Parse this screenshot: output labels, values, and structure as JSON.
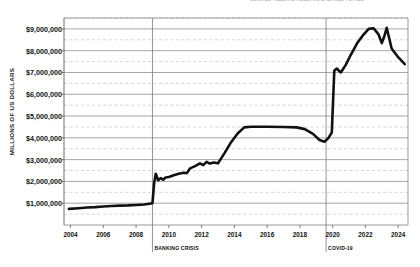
{
  "header": {
    "clipped_title": "SOURCE  FEDERAL RESERVE  BALANCE  TOTALS"
  },
  "axes": {
    "ylabel": "MILLIONS OF US DOLLARS",
    "xlabel": "",
    "y_ticks": [
      "$1,000,000",
      "$2,000,000",
      "$3,000,000",
      "$4,000,000",
      "$5,000,000",
      "$6,000,000",
      "$7,000,000",
      "$8,000,000",
      "$9,000,000"
    ],
    "x_ticks": [
      "2004",
      "2006",
      "2008",
      "2010",
      "2012",
      "2014",
      "2016",
      "2018",
      "2020",
      "2022",
      "2024"
    ]
  },
  "annotations": [
    {
      "name": "banking-crisis",
      "label": "BANKING CRISIS",
      "x": 2009.0
    },
    {
      "name": "covid-19",
      "label": "COVID-19",
      "x": 2019.6
    }
  ],
  "colors": {
    "line": "#111111",
    "major_grid": "#8f8f8f",
    "minor_grid": "#b8b8b8",
    "axis": "#6f6f6f",
    "text": "#111111"
  },
  "chart_data": {
    "type": "line",
    "title": "",
    "xlabel": "",
    "ylabel": "MILLIONS OF US DOLLARS",
    "xlim": [
      2003.6,
      2024.6
    ],
    "ylim": [
      0,
      9500000
    ],
    "grid": true,
    "major_gridline_interval": 1000000,
    "minor_gridline_interval": 500000,
    "legend": "none",
    "series": [
      {
        "name": "Total Assets",
        "x": [
          2003.9,
          2004.5,
          2005.0,
          2005.5,
          2006.0,
          2006.5,
          2007.0,
          2007.5,
          2008.0,
          2008.5,
          2008.9,
          2009.0,
          2009.1,
          2009.2,
          2009.35,
          2009.5,
          2009.65,
          2009.8,
          2010.0,
          2010.3,
          2010.6,
          2010.9,
          2011.1,
          2011.3,
          2011.6,
          2011.9,
          2012.1,
          2012.3,
          2012.5,
          2012.75,
          2013.0,
          2013.4,
          2013.8,
          2014.2,
          2014.6,
          2015.0,
          2016.0,
          2017.0,
          2017.8,
          2018.3,
          2018.8,
          2019.2,
          2019.5,
          2019.75,
          2019.95,
          2020.1,
          2020.25,
          2020.5,
          2020.8,
          2021.1,
          2021.5,
          2021.9,
          2022.2,
          2022.5,
          2022.8,
          2023.0,
          2023.15,
          2023.3,
          2023.6,
          2024.0,
          2024.4
        ],
        "y": [
          740000,
          770000,
          800000,
          820000,
          850000,
          870000,
          890000,
          900000,
          920000,
          940000,
          990000,
          1000000,
          1900000,
          2350000,
          2050000,
          2150000,
          2080000,
          2180000,
          2200000,
          2280000,
          2350000,
          2400000,
          2380000,
          2600000,
          2700000,
          2830000,
          2750000,
          2900000,
          2820000,
          2870000,
          2830000,
          3300000,
          3800000,
          4200000,
          4480000,
          4510000,
          4510000,
          4500000,
          4480000,
          4400000,
          4180000,
          3900000,
          3820000,
          4000000,
          4250000,
          7080000,
          7180000,
          7000000,
          7350000,
          7800000,
          8350000,
          8750000,
          9000000,
          9030000,
          8750000,
          8350000,
          8650000,
          9050000,
          8100000,
          7700000,
          7380000
        ]
      }
    ]
  }
}
